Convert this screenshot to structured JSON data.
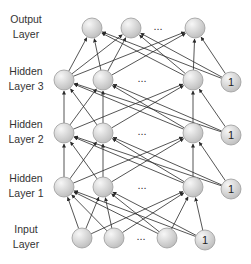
{
  "diagram": {
    "type": "feedforward-neural-network",
    "layers": [
      {
        "id": "input",
        "label_line1": "Input",
        "label_line2": "Layer",
        "y": 238,
        "nodes": [
          82,
          114,
          167
        ],
        "dots_x": 141,
        "bias": {
          "x": 205,
          "label": "1"
        }
      },
      {
        "id": "hidden1",
        "label_line1": "Hidden",
        "label_line2": "Layer 1",
        "y": 187,
        "nodes": [
          64,
          103,
          193
        ],
        "dots_x": 142,
        "bias": {
          "x": 231,
          "label": "1"
        }
      },
      {
        "id": "hidden2",
        "label_line1": "Hidden",
        "label_line2": "Layer 2",
        "y": 133,
        "nodes": [
          64,
          103,
          193
        ],
        "dots_x": 142,
        "bias": {
          "x": 231,
          "label": "1"
        }
      },
      {
        "id": "hidden3",
        "label_line1": "Hidden",
        "label_line2": "Layer 3",
        "y": 80,
        "nodes": [
          64,
          103,
          193
        ],
        "dots_x": 142,
        "bias": {
          "x": 231,
          "label": "1"
        }
      },
      {
        "id": "output",
        "label_line1": "Output",
        "label_line2": "Layer",
        "y": 28,
        "nodes": [
          92,
          131,
          195
        ],
        "dots_x": 158,
        "bias": null
      }
    ],
    "ellipsis": "...",
    "node_radius": 10,
    "colors": {
      "node_fill_light": "#f2f2f2",
      "node_fill_dark": "#c4c4c4",
      "node_stroke": "#9a9a9a",
      "edge": "#2a2a2a"
    }
  }
}
